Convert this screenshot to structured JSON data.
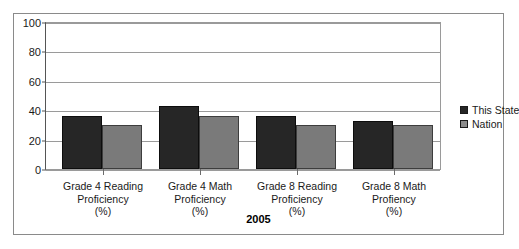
{
  "chart_data": {
    "type": "bar",
    "title": "",
    "subtitle": "",
    "xlabel": "2005",
    "ylabel": "",
    "ylim": [
      0,
      100
    ],
    "yticks": [
      0,
      20,
      40,
      60,
      80,
      100
    ],
    "grid": true,
    "legend_position": "right",
    "categories": [
      "Grade 4 Reading\nProficiency\n(%)",
      "Grade 4 Math\nProficiency\n(%)",
      "Grade 8 Reading\nProficiency\n(%)",
      "Grade 8 Math\nProfiency\n(%)"
    ],
    "category_lines": [
      [
        "Grade 4 Reading",
        "Proficiency",
        "(%)"
      ],
      [
        "Grade 4 Math",
        "Proficiency",
        "(%)"
      ],
      [
        "Grade 8 Reading",
        "Proficiency",
        "(%)"
      ],
      [
        "Grade 8 Math",
        "Profiency",
        "(%)"
      ]
    ],
    "series": [
      {
        "name": "This State",
        "color": "#262626",
        "values": [
          36,
          43,
          36,
          33
        ]
      },
      {
        "name": "Nation",
        "color": "#7a7a7a",
        "values": [
          30,
          36,
          30,
          30
        ]
      }
    ]
  },
  "legend": {
    "items": [
      {
        "label": "This State",
        "color": "#262626"
      },
      {
        "label": "Nation",
        "color": "#8c8c8c"
      }
    ]
  },
  "axis": {
    "y_labels": [
      "100",
      "80",
      "60",
      "40",
      "20",
      "0"
    ]
  },
  "footer": {
    "year": "2005"
  }
}
